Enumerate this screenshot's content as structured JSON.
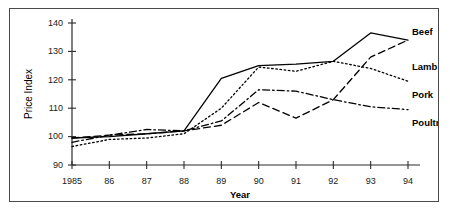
{
  "chart_data": {
    "type": "line",
    "title": "",
    "xlabel": "Year",
    "ylabel": "Price Index",
    "categories": [
      "1985",
      "86",
      "87",
      "88",
      "89",
      "90",
      "91",
      "92",
      "93",
      "94"
    ],
    "x": [
      1985,
      1986,
      1987,
      1988,
      1989,
      1990,
      1991,
      1992,
      1993,
      1994
    ],
    "ylim": [
      90,
      140
    ],
    "yticks": [
      90,
      100,
      110,
      120,
      130,
      140
    ],
    "grid": false,
    "legend_position": "right-inline-labels",
    "series": [
      {
        "name": "Beef",
        "style": "solid",
        "values": [
          99.5,
          100.0,
          101.0,
          102.0,
          120.5,
          125.0,
          125.5,
          126.5,
          136.5,
          134.0
        ]
      },
      {
        "name": "Lamb",
        "style": "dashed",
        "values": [
          99.5,
          100.5,
          101.0,
          102.0,
          104.0,
          112.0,
          106.5,
          113.0,
          128.0,
          134.0
        ]
      },
      {
        "name": "Pork",
        "style": "dotted",
        "values": [
          96.5,
          99.0,
          99.5,
          101.0,
          110.0,
          124.5,
          123.0,
          126.5,
          124.0,
          119.5
        ]
      },
      {
        "name": "Poultry",
        "style": "dash-dot",
        "values": [
          98.0,
          100.5,
          102.5,
          102.0,
          105.5,
          116.5,
          116.0,
          113.0,
          110.5,
          109.5
        ]
      }
    ]
  }
}
